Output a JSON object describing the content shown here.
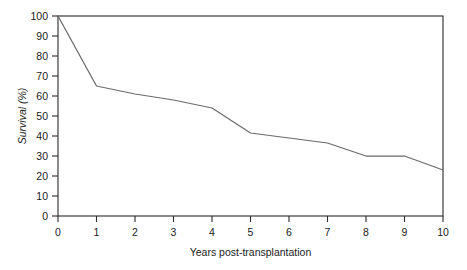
{
  "chart_data": {
    "type": "line",
    "title": "",
    "xlabel": "Years post-transplantation",
    "ylabel": "Survival (%)",
    "xlim": [
      0,
      10
    ],
    "ylim": [
      0,
      100
    ],
    "grid": false,
    "legend": false,
    "x": [
      0,
      1,
      2,
      3,
      4,
      5,
      6,
      7,
      8,
      9,
      10
    ],
    "values": [
      100,
      65,
      61,
      58,
      54,
      41.5,
      39,
      36.5,
      30,
      30,
      23
    ],
    "series": [
      {
        "name": "Survival",
        "values": [
          100,
          65,
          61,
          58,
          54,
          41.5,
          39,
          36.5,
          30,
          30,
          23
        ],
        "color": "#6b6b6b"
      }
    ],
    "x_tick_labels": [
      "0",
      "1",
      "2",
      "3",
      "4",
      "5",
      "6",
      "7",
      "8",
      "9",
      "10"
    ],
    "y_tick_labels": [
      "0",
      "10",
      "20",
      "30",
      "40",
      "50",
      "60",
      "70",
      "80",
      "90",
      "100"
    ],
    "y_tick_values": [
      0,
      10,
      20,
      30,
      40,
      50,
      60,
      70,
      80,
      90,
      100
    ],
    "axis_color": "#2b2b2b",
    "line_color": "#6b6b6b",
    "background": "#ffffff"
  }
}
